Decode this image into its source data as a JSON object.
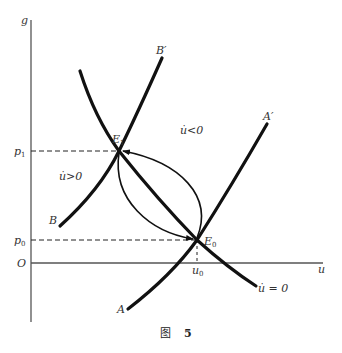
{
  "figure": {
    "caption_char": "图",
    "caption_num": "5",
    "axes": {
      "y_label": "g",
      "x_label": "u",
      "origin_label": "O"
    },
    "ticks": {
      "p1": "p",
      "p1_sub": "1",
      "p0": "p",
      "p0_sub": "0",
      "u0": "u",
      "u0_sub": "0"
    },
    "points": {
      "E1": "E",
      "E1_sub": "1",
      "E0": "E",
      "E0_sub": "0"
    },
    "curves": {
      "B": "B",
      "B_prime": "B′",
      "A": "A",
      "A_prime": "A′",
      "u_dot_zero": "u̇ = 0"
    },
    "regions": {
      "u_dot_neg": "u̇<0",
      "u_dot_pos": "u̇>0"
    },
    "colors": {
      "curve": "#111111",
      "axis": "#555555",
      "text": "#333333"
    }
  }
}
